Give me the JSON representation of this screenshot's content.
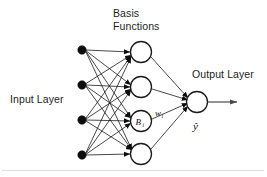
{
  "diagram": {
    "background_color": "#ffffff",
    "ink_color": "#1a1a1a",
    "labels": {
      "input_layer": "Input Layer",
      "basis_functions_line1": "Basis",
      "basis_functions_line2": "Functions",
      "output_layer": "Output Layer",
      "basis_node_symbol": "B",
      "basis_node_subscript": "i",
      "weight_symbol": "w",
      "weight_subscript": "i",
      "output_symbol": "ŷ"
    },
    "layers": [
      {
        "name": "input-layer",
        "label": "Input Layer",
        "node_style": "filled",
        "node_count": 4,
        "x": 82,
        "node_radius": 4.2,
        "nodes_y": [
          50,
          85,
          120,
          155
        ]
      },
      {
        "name": "basis-function-layer",
        "label": "Basis Functions",
        "node_style": "open",
        "node_count": 4,
        "x": 141,
        "node_radius": 10.5,
        "nodes_y": [
          52,
          87,
          121,
          154
        ],
        "labeled_node_index": 2
      },
      {
        "name": "output-layer",
        "label": "Output Layer",
        "node_style": "open",
        "node_count": 1,
        "x": 197,
        "node_radius": 10.5,
        "nodes_y": [
          102
        ]
      }
    ],
    "connections": {
      "input_to_basis": "fully-connected",
      "input_to_basis_count": 16,
      "basis_to_output": "fully-connected",
      "basis_to_output_count": 4,
      "arrowheads": "filled-triangle"
    },
    "output_arrow": {
      "from_x": 208,
      "to_x": 240,
      "y": 102
    },
    "label_positions": {
      "input_layer": {
        "x": 10,
        "y": 103
      },
      "basis_functions": {
        "x": 113,
        "y": 17
      },
      "output_layer": {
        "x": 192,
        "y": 78
      },
      "output_symbol": {
        "x": 193,
        "y": 128
      },
      "weight": {
        "x": 155,
        "y": 116
      }
    }
  }
}
